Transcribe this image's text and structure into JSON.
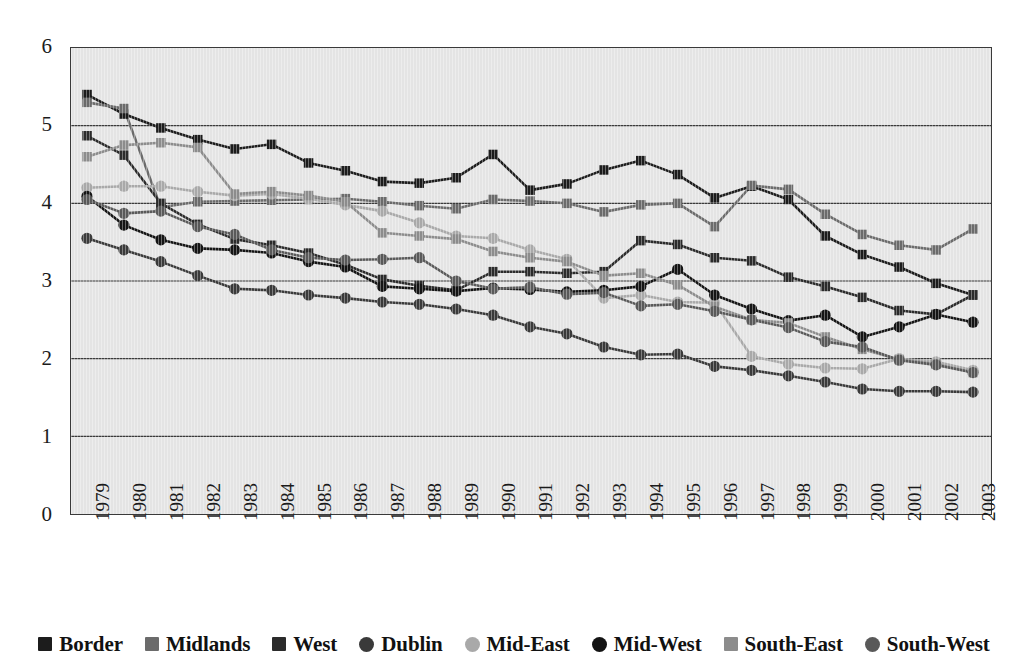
{
  "chart_data": {
    "type": "line",
    "title": "",
    "xlabel": "",
    "ylabel": "",
    "ylim": [
      0,
      6
    ],
    "yticks": [
      0,
      1,
      2,
      3,
      4,
      5,
      6
    ],
    "grid": true,
    "legend_position": "bottom",
    "categories": [
      "1979",
      "1980",
      "1981",
      "1982",
      "1983",
      "1984",
      "1985",
      "1986",
      "1987",
      "1988",
      "1989",
      "1990",
      "1991",
      "1992",
      "1993",
      "1994",
      "1995",
      "1996",
      "1997",
      "1998",
      "1999",
      "2000",
      "2001",
      "2002",
      "2003"
    ],
    "series": [
      {
        "name": "Border",
        "marker": "square",
        "color": "#1c1c1c",
        "values": [
          5.4,
          5.15,
          4.97,
          4.82,
          4.7,
          4.76,
          4.52,
          4.42,
          4.28,
          4.26,
          4.33,
          4.63,
          4.17,
          4.25,
          4.43,
          4.55,
          4.37,
          4.07,
          4.22,
          4.05,
          3.58,
          3.34,
          3.18,
          2.97,
          2.82
        ]
      },
      {
        "name": "Midlands",
        "marker": "square",
        "color": "#6b6b6b",
        "values": [
          5.3,
          5.22,
          3.95,
          4.02,
          4.03,
          4.04,
          4.05,
          4.06,
          4.02,
          3.97,
          3.93,
          4.05,
          4.03,
          4.0,
          3.89,
          3.98,
          4.0,
          3.7,
          4.23,
          4.18,
          3.86,
          3.6,
          3.46,
          3.4,
          3.67
        ]
      },
      {
        "name": "West",
        "marker": "square",
        "color": "#2b2b2b",
        "values": [
          4.87,
          4.62,
          4.0,
          3.73,
          3.54,
          3.46,
          3.36,
          3.21,
          3.02,
          2.94,
          2.88,
          3.12,
          3.12,
          3.1,
          3.12,
          3.52,
          3.47,
          3.3,
          3.26,
          3.05,
          2.93,
          2.79,
          2.62,
          2.57,
          2.82
        ]
      },
      {
        "name": "Dublin",
        "marker": "circle",
        "color": "#3a3a3a",
        "values": [
          3.55,
          3.4,
          3.25,
          3.07,
          2.9,
          2.88,
          2.82,
          2.78,
          2.73,
          2.7,
          2.64,
          2.56,
          2.41,
          2.32,
          2.15,
          2.05,
          2.06,
          1.9,
          1.85,
          1.78,
          1.7,
          1.61,
          1.58,
          1.58,
          1.57
        ]
      },
      {
        "name": "Mid-East",
        "marker": "circle",
        "color": "#a9a9a9",
        "values": [
          4.2,
          4.22,
          4.22,
          4.15,
          4.1,
          4.12,
          4.06,
          3.98,
          3.9,
          3.75,
          3.58,
          3.55,
          3.4,
          3.28,
          2.78,
          2.82,
          2.73,
          2.72,
          2.03,
          1.93,
          1.88,
          1.87,
          2.0,
          1.96,
          1.85
        ]
      },
      {
        "name": "Mid-West",
        "marker": "circle",
        "color": "#141414",
        "values": [
          4.09,
          3.72,
          3.53,
          3.42,
          3.4,
          3.36,
          3.25,
          3.18,
          2.93,
          2.9,
          2.87,
          2.91,
          2.89,
          2.86,
          2.88,
          2.93,
          3.15,
          2.82,
          2.64,
          2.49,
          2.56,
          2.28,
          2.41,
          2.57,
          2.47
        ]
      },
      {
        "name": "South-East",
        "marker": "square",
        "color": "#8c8c8c",
        "values": [
          4.6,
          4.75,
          4.78,
          4.72,
          4.12,
          4.15,
          4.1,
          4.02,
          3.62,
          3.58,
          3.54,
          3.38,
          3.3,
          3.25,
          3.07,
          3.1,
          2.95,
          2.67,
          2.5,
          2.46,
          2.28,
          2.12,
          1.99,
          1.93,
          1.82
        ]
      },
      {
        "name": "South-West",
        "marker": "circle",
        "color": "#595959",
        "values": [
          4.05,
          3.87,
          3.9,
          3.7,
          3.6,
          3.4,
          3.3,
          3.27,
          3.28,
          3.3,
          3.0,
          2.9,
          2.92,
          2.83,
          2.85,
          2.68,
          2.7,
          2.61,
          2.5,
          2.4,
          2.22,
          2.15,
          1.98,
          1.92,
          1.82
        ]
      }
    ]
  },
  "legend": {
    "items": [
      {
        "label": "Border",
        "marker": "square",
        "color": "#1c1c1c"
      },
      {
        "label": "Midlands",
        "marker": "square",
        "color": "#6b6b6b"
      },
      {
        "label": "West",
        "marker": "square",
        "color": "#2b2b2b"
      },
      {
        "label": "Dublin",
        "marker": "circle",
        "color": "#3a3a3a"
      },
      {
        "label": "Mid-East",
        "marker": "circle",
        "color": "#a9a9a9"
      },
      {
        "label": "Mid-West",
        "marker": "circle",
        "color": "#141414"
      },
      {
        "label": "South-East",
        "marker": "square",
        "color": "#8c8c8c"
      },
      {
        "label": "South-West",
        "marker": "circle",
        "color": "#595959"
      }
    ]
  },
  "colors": {
    "plot_background": "#e4e4e4",
    "page_background": "#ffffff",
    "gridline": "#3a3a3a",
    "axis_text": "#1b1b1b"
  }
}
